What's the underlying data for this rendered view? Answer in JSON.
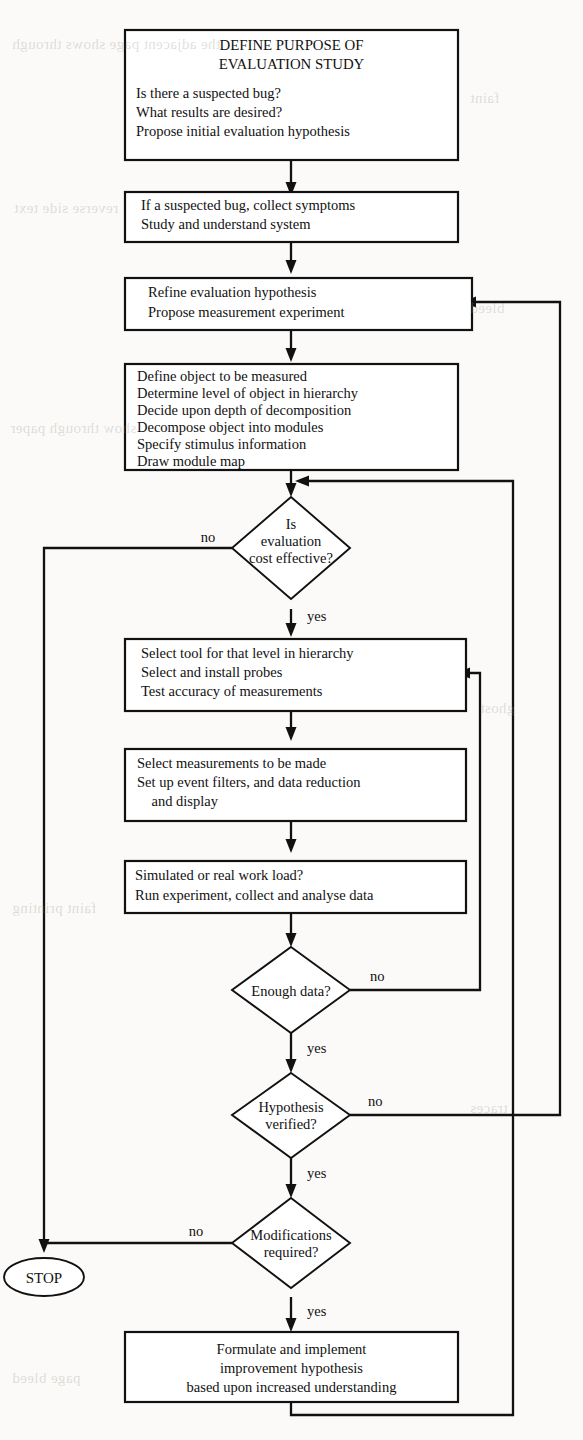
{
  "diagram": {
    "type": "flowchart",
    "orientation": "top-to-bottom",
    "colors": {
      "line": "#111111",
      "node_fill": "#ffffff",
      "page_background": "#fbfaf8"
    },
    "nodes": [
      {
        "id": "n1",
        "shape": "process",
        "heading": [
          "DEFINE PURPOSE OF",
          "EVALUATION STUDY"
        ],
        "lines": [
          "Is there a suspected bug?",
          "What results are desired?",
          "Propose initial evaluation hypothesis"
        ]
      },
      {
        "id": "n2",
        "shape": "process",
        "heading": [],
        "lines": [
          "If a suspected bug, collect symptoms",
          "Study and understand system"
        ]
      },
      {
        "id": "n3",
        "shape": "process",
        "heading": [],
        "lines": [
          "Refine evaluation hypothesis",
          "Propose measurement experiment"
        ]
      },
      {
        "id": "n4",
        "shape": "process",
        "heading": [],
        "lines": [
          "Define object to be measured",
          "Determine level of object in hierarchy",
          "Decide upon depth of decomposition",
          "Decompose object into modules",
          "Specify stimulus information",
          "Draw module map"
        ]
      },
      {
        "id": "d1",
        "shape": "decision",
        "heading": [],
        "lines": [
          "Is",
          "evaluation",
          "cost effective?"
        ]
      },
      {
        "id": "n5",
        "shape": "process",
        "heading": [],
        "lines": [
          "Select tool for that level in hierarchy",
          "Select and install probes",
          "Test accuracy of measurements"
        ]
      },
      {
        "id": "n6",
        "shape": "process",
        "heading": [],
        "lines": [
          "Select measurements to be made",
          "Set up event filters, and data reduction",
          "    and display"
        ]
      },
      {
        "id": "n7",
        "shape": "process",
        "heading": [],
        "lines": [
          "Simulated or real work load?",
          "Run experiment, collect and analyse data"
        ]
      },
      {
        "id": "d2",
        "shape": "decision",
        "heading": [],
        "lines": [
          "Enough data?"
        ]
      },
      {
        "id": "d3",
        "shape": "decision",
        "heading": [],
        "lines": [
          "Hypothesis",
          "verified?"
        ]
      },
      {
        "id": "d4",
        "shape": "decision",
        "heading": [],
        "lines": [
          "Modifications",
          "required?"
        ]
      },
      {
        "id": "stop",
        "shape": "terminator",
        "heading": [],
        "lines": [
          "STOP"
        ]
      },
      {
        "id": "n8",
        "shape": "process",
        "heading": [],
        "lines": [
          "Formulate and implement",
          "improvement hypothesis",
          "based upon increased understanding"
        ]
      }
    ],
    "edge_labels": {
      "cost_effective_no": "no",
      "cost_effective_yes": "yes",
      "enough_data_no": "no",
      "enough_data_yes": "yes",
      "hypothesis_no": "no",
      "hypothesis_yes": "yes",
      "modifications_no": "no",
      "modifications_yes": "yes"
    },
    "edges": [
      {
        "from": "n1",
        "to": "n2",
        "label": ""
      },
      {
        "from": "n2",
        "to": "n3",
        "label": ""
      },
      {
        "from": "n3",
        "to": "n4",
        "label": ""
      },
      {
        "from": "n4",
        "to": "d1",
        "label": ""
      },
      {
        "from": "d1",
        "to": "stop",
        "label": "no"
      },
      {
        "from": "d1",
        "to": "n5",
        "label": "yes"
      },
      {
        "from": "n5",
        "to": "n6",
        "label": ""
      },
      {
        "from": "n6",
        "to": "n7",
        "label": ""
      },
      {
        "from": "n7",
        "to": "d2",
        "label": ""
      },
      {
        "from": "d2",
        "to": "n5",
        "label": "no"
      },
      {
        "from": "d2",
        "to": "d3",
        "label": "yes"
      },
      {
        "from": "d3",
        "to": "n3",
        "label": "no"
      },
      {
        "from": "d3",
        "to": "d4",
        "label": "yes"
      },
      {
        "from": "d4",
        "to": "stop",
        "label": "no"
      },
      {
        "from": "d4",
        "to": "n8",
        "label": "yes"
      },
      {
        "from": "n8",
        "to": "d1",
        "label": ""
      }
    ]
  },
  "bleed_text": [
    {
      "x": 12,
      "y": 36,
      "text": "the adjacent page shows through"
    },
    {
      "x": 470,
      "y": 90,
      "text": "faint"
    },
    {
      "x": 14,
      "y": 200,
      "text": "reverse side text"
    },
    {
      "x": 470,
      "y": 300,
      "text": "bleed"
    },
    {
      "x": 10,
      "y": 420,
      "text": "show through paper"
    },
    {
      "x": 480,
      "y": 700,
      "text": "ghost"
    },
    {
      "x": 12,
      "y": 900,
      "text": "faint printing"
    },
    {
      "x": 470,
      "y": 1100,
      "text": "traces"
    },
    {
      "x": 12,
      "y": 1370,
      "text": "page bleed"
    }
  ]
}
